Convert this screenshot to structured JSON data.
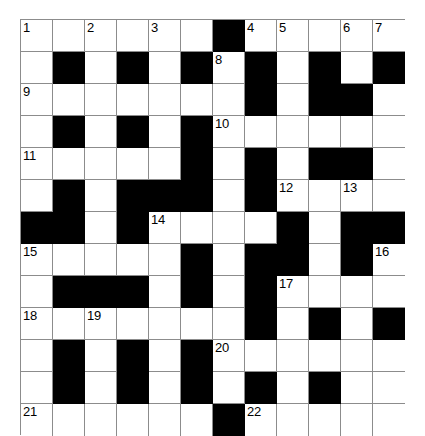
{
  "puzzle": {
    "kind": "crossword-grid",
    "title": "",
    "columns": 12,
    "rows": 12,
    "cell_size_px": 32,
    "colors": {
      "white_cell": "#ffffff",
      "block_cell": "#000000",
      "grid_line": "#8c8c8c",
      "number_text": "#000000",
      "background": "#ffffff"
    },
    "legend": {
      "white": "open letter square",
      "block": "blocked square"
    },
    "grid": [
      [
        "white",
        "white",
        "white",
        "white",
        "white",
        "white",
        "block",
        "white",
        "white",
        "white",
        "white",
        "white"
      ],
      [
        "white",
        "block",
        "white",
        "block",
        "white",
        "block",
        "white",
        "block",
        "white",
        "block",
        "white",
        "block"
      ],
      [
        "white",
        "white",
        "white",
        "white",
        "white",
        "white",
        "white",
        "block",
        "white",
        "block",
        "block",
        "white"
      ],
      [
        "white",
        "block",
        "white",
        "block",
        "white",
        "block",
        "white",
        "white",
        "white",
        "white",
        "white",
        "white"
      ],
      [
        "white",
        "white",
        "white",
        "white",
        "white",
        "block",
        "white",
        "block",
        "white",
        "block",
        "block",
        "white"
      ],
      [
        "white",
        "block",
        "white",
        "block",
        "block",
        "block",
        "white",
        "block",
        "white",
        "white",
        "white",
        "white"
      ],
      [
        "block",
        "block",
        "white",
        "block",
        "white",
        "white",
        "white",
        "white",
        "block",
        "white",
        "block",
        "block"
      ],
      [
        "white",
        "white",
        "white",
        "white",
        "white",
        "block",
        "white",
        "block",
        "block",
        "white",
        "block",
        "white"
      ],
      [
        "white",
        "block",
        "block",
        "block",
        "white",
        "block",
        "white",
        "block",
        "white",
        "white",
        "white",
        "white"
      ],
      [
        "white",
        "white",
        "white",
        "white",
        "white",
        "white",
        "white",
        "block",
        "white",
        "block",
        "white",
        "block"
      ],
      [
        "white",
        "block",
        "white",
        "block",
        "white",
        "block",
        "white",
        "white",
        "white",
        "white",
        "white",
        "white"
      ],
      [
        "white",
        "block",
        "white",
        "block",
        "white",
        "block",
        "white",
        "block",
        "white",
        "block",
        "white",
        "white"
      ],
      [
        "white",
        "white",
        "white",
        "white",
        "white",
        "white",
        "block",
        "white",
        "white",
        "white",
        "white",
        "white"
      ]
    ],
    "numbers": [
      {
        "row": 0,
        "col": 0,
        "label": "1"
      },
      {
        "row": 0,
        "col": 2,
        "label": "2"
      },
      {
        "row": 0,
        "col": 4,
        "label": "3"
      },
      {
        "row": 0,
        "col": 7,
        "label": "4"
      },
      {
        "row": 0,
        "col": 8,
        "label": "5"
      },
      {
        "row": 0,
        "col": 10,
        "label": "6"
      },
      {
        "row": 1,
        "col": 6,
        "label": "8"
      },
      {
        "row": 2,
        "col": 0,
        "label": "9"
      },
      {
        "row": 3,
        "col": 6,
        "label": "10"
      },
      {
        "row": 4,
        "col": 0,
        "label": "11"
      },
      {
        "row": 5,
        "col": 8,
        "label": "12"
      },
      {
        "row": 5,
        "col": 10,
        "label": "13"
      },
      {
        "row": 6,
        "col": 4,
        "label": "14"
      },
      {
        "row": 7,
        "col": 0,
        "label": "15"
      },
      {
        "row": 7,
        "col": 11,
        "label": "16"
      },
      {
        "row": 8,
        "col": 8,
        "label": "17"
      },
      {
        "row": 9,
        "col": 0,
        "label": "18"
      },
      {
        "row": 9,
        "col": 2,
        "label": "19"
      },
      {
        "row": 10,
        "col": 6,
        "label": "20"
      },
      {
        "row": 12,
        "col": 0,
        "label": "21"
      },
      {
        "row": 12,
        "col": 7,
        "label": "22"
      }
    ],
    "extra_numbers": [
      {
        "row": 0,
        "col": 11,
        "label": "7"
      }
    ]
  }
}
